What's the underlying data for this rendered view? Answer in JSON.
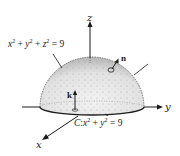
{
  "diagram": {
    "surface_equation": {
      "lhs_terms": [
        "x",
        "y",
        "z"
      ],
      "exponent": "2",
      "rhs": "9",
      "text": "x² + y² + z² = 9"
    },
    "boundary_curve": {
      "name": "C",
      "text": "C: x² + y² = 9",
      "lhs_terms": [
        "x",
        "y"
      ],
      "exponent": "2",
      "rhs": "9"
    },
    "axes": {
      "x": "x",
      "y": "y",
      "z": "z"
    },
    "vectors": {
      "normal": "n",
      "unit_k": "k"
    },
    "colors": {
      "ink": "#1a1a1a",
      "shading": "#cfcfcf",
      "background": "#ffffff"
    }
  }
}
